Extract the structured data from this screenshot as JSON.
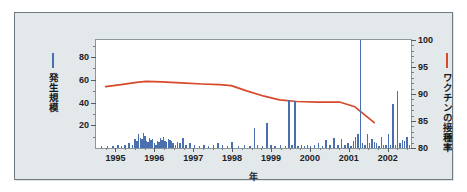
{
  "chart_data": {
    "type": "bar",
    "title": "",
    "xlabel": "年",
    "ylabel_left": "発生規模",
    "ylabel_right": "ワクチンの接種率",
    "grid": false,
    "xlim": [
      1994.5,
      2002.6
    ],
    "xticks": [
      "1995",
      "1996",
      "1997",
      "1998",
      "1999",
      "2000",
      "2001",
      "2002"
    ],
    "xtick_values": [
      1995,
      1996,
      1997,
      1998,
      1999,
      2000,
      2001,
      2002
    ],
    "ylim_left": [
      0,
      95
    ],
    "yticks_left": [
      "20",
      "40",
      "60",
      "80"
    ],
    "ytick_values_left": [
      20,
      40,
      60,
      80
    ],
    "ylim_right": [
      80,
      100
    ],
    "yticks_right": [
      "80",
      "85",
      "90",
      "95",
      "100"
    ],
    "ytick_values_right": [
      80,
      85,
      90,
      95,
      100
    ],
    "legend_position": "outside-left-and-right",
    "series": [
      {
        "name": "発生規模",
        "type": "bar",
        "axis": "left",
        "color": "#4a6fae",
        "x": [
          1994.62,
          1994.78,
          1994.92,
          1995.05,
          1995.14,
          1995.23,
          1995.33,
          1995.42,
          1995.48,
          1995.54,
          1995.58,
          1995.62,
          1995.66,
          1995.7,
          1995.74,
          1995.78,
          1995.82,
          1995.86,
          1995.9,
          1995.94,
          1995.98,
          1996.02,
          1996.06,
          1996.1,
          1996.14,
          1996.18,
          1996.22,
          1996.26,
          1996.3,
          1996.34,
          1996.38,
          1996.42,
          1996.46,
          1996.52,
          1996.58,
          1996.64,
          1996.72,
          1996.8,
          1996.9,
          1997.02,
          1997.14,
          1997.26,
          1997.38,
          1997.5,
          1997.62,
          1997.74,
          1997.86,
          1997.98,
          1998.14,
          1998.3,
          1998.44,
          1998.56,
          1998.64,
          1998.76,
          1998.88,
          1998.98,
          1999.08,
          1999.22,
          1999.36,
          1999.44,
          1999.52,
          1999.6,
          1999.68,
          1999.76,
          1999.84,
          1999.92,
          2000.0,
          2000.1,
          2000.2,
          2000.3,
          2000.4,
          2000.5,
          2000.6,
          2000.7,
          2000.8,
          2000.88,
          2000.96,
          2001.04,
          2001.1,
          2001.16,
          2001.22,
          2001.28,
          2001.34,
          2001.4,
          2001.46,
          2001.52,
          2001.58,
          2001.64,
          2001.7,
          2001.76,
          2001.82,
          2001.88,
          2001.94,
          2002.0,
          2002.06,
          2002.12,
          2002.18,
          2002.24,
          2002.3,
          2002.36,
          2002.42,
          2002.48,
          2002.54
        ],
        "values": [
          2,
          2,
          2,
          3,
          2,
          3,
          4,
          3,
          8,
          6,
          12,
          9,
          8,
          13,
          11,
          6,
          5,
          9,
          7,
          8,
          4,
          3,
          6,
          5,
          9,
          7,
          10,
          6,
          5,
          8,
          7,
          6,
          4,
          3,
          5,
          4,
          9,
          3,
          4,
          3,
          2,
          3,
          2,
          3,
          4,
          3,
          2,
          5,
          2,
          3,
          2,
          18,
          3,
          2,
          22,
          3,
          2,
          3,
          2,
          42,
          3,
          41,
          2,
          3,
          2,
          3,
          2,
          3,
          4,
          2,
          7,
          3,
          9,
          3,
          8,
          3,
          4,
          2,
          6,
          10,
          12,
          95,
          4,
          3,
          12,
          4,
          8,
          5,
          4,
          2,
          10,
          3,
          3,
          12,
          3,
          39,
          3,
          50,
          4,
          7,
          6,
          10,
          3
        ]
      },
      {
        "name": "ワクチンの接種率",
        "type": "line",
        "axis": "right",
        "color": "#d8482a",
        "x": [
          1994.75,
          1995.15,
          1995.55,
          1995.8,
          1996.2,
          1996.7,
          1997.25,
          1997.7,
          1998.0,
          1998.4,
          1998.85,
          1999.25,
          1999.7,
          2000.25,
          2000.8,
          2001.2,
          2001.7
        ],
        "values": [
          91.2,
          91.6,
          92.0,
          92.2,
          92.1,
          91.9,
          91.7,
          91.6,
          91.4,
          90.4,
          89.4,
          88.7,
          88.4,
          88.3,
          88.3,
          87.4,
          84.4
        ]
      }
    ]
  },
  "legend_left": {
    "label": "発生規模",
    "marker": "vertical-bar",
    "color": "#4a6fae"
  },
  "legend_right": {
    "label": "ワクチンの接種率",
    "marker": "line",
    "color": "#d8482a"
  }
}
